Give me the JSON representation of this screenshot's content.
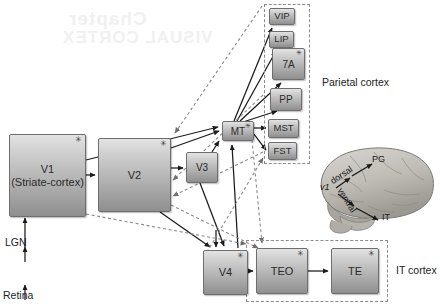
{
  "figure": {
    "title_ghost_lines": [
      "VISUAL CORTEX",
      "Chapter"
    ],
    "background": "#ffffff"
  },
  "inputs": [
    {
      "id": "lgn",
      "label": "LGN"
    },
    {
      "id": "retina",
      "label": "Retina"
    }
  ],
  "nodes": [
    {
      "id": "v1",
      "label": "V1",
      "sublabel": "(Striate-cortex)",
      "star": true,
      "x": 9,
      "y": 134,
      "w": 77,
      "h": 83,
      "size": "big"
    },
    {
      "id": "v2",
      "label": "V2",
      "sublabel": "",
      "star": true,
      "x": 98,
      "y": 138,
      "w": 73,
      "h": 74,
      "size": "big"
    },
    {
      "id": "v3",
      "label": "V3",
      "sublabel": "",
      "star": false,
      "x": 186,
      "y": 152,
      "w": 32,
      "h": 31,
      "size": "mid"
    },
    {
      "id": "mt",
      "label": "MT",
      "sublabel": "",
      "star": true,
      "x": 222,
      "y": 121,
      "w": 32,
      "h": 20,
      "size": "mid"
    },
    {
      "id": "vip",
      "label": "VIP",
      "sublabel": "",
      "star": false,
      "x": 269,
      "y": 8,
      "w": 26,
      "h": 17,
      "size": "small"
    },
    {
      "id": "lip",
      "label": "LIP",
      "sublabel": "",
      "star": false,
      "x": 269,
      "y": 31,
      "w": 25,
      "h": 17,
      "size": "small"
    },
    {
      "id": "7a",
      "label": "7A",
      "sublabel": "",
      "star": true,
      "x": 272,
      "y": 48,
      "w": 33,
      "h": 32,
      "size": "mid"
    },
    {
      "id": "pp",
      "label": "PP",
      "sublabel": "",
      "star": false,
      "x": 270,
      "y": 88,
      "w": 32,
      "h": 23,
      "size": "mid"
    },
    {
      "id": "mst",
      "label": "MST",
      "sublabel": "",
      "star": false,
      "x": 268,
      "y": 119,
      "w": 31,
      "h": 19,
      "size": "small"
    },
    {
      "id": "fst",
      "label": "FST",
      "sublabel": "",
      "star": false,
      "x": 268,
      "y": 142,
      "w": 29,
      "h": 18,
      "size": "small"
    },
    {
      "id": "v4",
      "label": "V4",
      "sublabel": "",
      "star": true,
      "x": 203,
      "y": 250,
      "w": 45,
      "h": 45,
      "size": "big"
    },
    {
      "id": "teo",
      "label": "TEO",
      "sublabel": "",
      "star": true,
      "x": 256,
      "y": 248,
      "w": 52,
      "h": 46,
      "size": "big"
    },
    {
      "id": "te",
      "label": "TE",
      "sublabel": "",
      "star": true,
      "x": 331,
      "y": 248,
      "w": 48,
      "h": 46,
      "size": "big"
    }
  ],
  "regions": [
    {
      "id": "parietal",
      "label": "Parietal cortex",
      "x": 264,
      "y": 4,
      "w": 46,
      "h": 160,
      "label_x": 322,
      "label_y": 76
    },
    {
      "id": "it",
      "label": "IT cortex",
      "x": 246,
      "y": 240,
      "w": 142,
      "h": 62,
      "label_x": 396,
      "label_y": 266
    }
  ],
  "brain": {
    "labels": [
      {
        "id": "v1-brain",
        "text": "v1"
      },
      {
        "id": "dorsal",
        "text": "dorsal"
      },
      {
        "id": "ventral",
        "text": "ventral"
      },
      {
        "id": "pg",
        "text": "PG"
      },
      {
        "id": "it-brain",
        "text": "IT"
      }
    ]
  },
  "edges_solid": [
    "retina-to-lgn",
    "lgn-to-v1",
    "v1-to-v2",
    "v1-to-mt",
    "v2-to-v3",
    "v2-to-mt",
    "v2-to-v4",
    "v3-to-v4",
    "v3-to-mt",
    "mt-to-vip",
    "mt-to-lip",
    "mt-to-7a",
    "mt-to-pp",
    "mt-to-mst",
    "mt-to-fst",
    "mt-to-v4",
    "v4-to-mt",
    "v4-to-teo",
    "teo-to-te"
  ],
  "edges_dashed": [
    "v2-feedback-from-parietal",
    "v1-feedback-from-v4",
    "mt-feedback-to-v2",
    "mt-to-teo-dashed",
    "v4-to-fst-dashed",
    "v1-to-teo-dashed"
  ],
  "legend": {
    "asterisk_note": "*"
  }
}
